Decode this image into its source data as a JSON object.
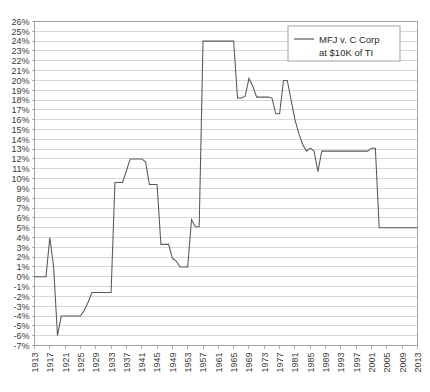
{
  "chart_data": {
    "type": "line",
    "title": "",
    "subtitle": "",
    "xlabel": "",
    "ylabel": "",
    "xlim": [
      1913,
      2013
    ],
    "ylim": [
      -7,
      26
    ],
    "ytick_step": 1,
    "xtick_step": 4,
    "grid": true,
    "grid_axis": "y",
    "legend_position": "top-right",
    "legend": [
      "MFJ v. C Corp at $10K of TI"
    ],
    "series": [
      {
        "name": "MFJ v. C Corp at $10K of TI",
        "color": "#585858",
        "x": [
          1913,
          1914,
          1915,
          1916,
          1917,
          1918,
          1919,
          1920,
          1921,
          1922,
          1923,
          1924,
          1925,
          1926,
          1927,
          1928,
          1929,
          1930,
          1931,
          1932,
          1933,
          1934,
          1935,
          1936,
          1937,
          1938,
          1939,
          1940,
          1941,
          1942,
          1943,
          1944,
          1945,
          1946,
          1947,
          1948,
          1949,
          1950,
          1951,
          1952,
          1953,
          1954,
          1955,
          1956,
          1957,
          1958,
          1959,
          1960,
          1961,
          1962,
          1963,
          1964,
          1965,
          1966,
          1967,
          1968,
          1969,
          1970,
          1971,
          1972,
          1973,
          1974,
          1975,
          1976,
          1977,
          1978,
          1979,
          1980,
          1981,
          1982,
          1983,
          1984,
          1985,
          1986,
          1987,
          1988,
          1989,
          1990,
          1991,
          1992,
          1993,
          1994,
          1995,
          1996,
          1997,
          1998,
          1999,
          2000,
          2001,
          2002,
          2003,
          2004,
          2005,
          2006,
          2007,
          2008,
          2009,
          2010,
          2011,
          2012,
          2013
        ],
        "y": [
          0,
          0,
          0,
          0,
          4,
          1,
          -6,
          -4,
          -4,
          -4,
          -4,
          -4,
          -4,
          -3.4,
          -2.6,
          -1.6,
          -1.6,
          -1.6,
          -1.6,
          -1.6,
          -1.6,
          9.6,
          9.6,
          9.6,
          10.8,
          12,
          12,
          12,
          12,
          11.7,
          9.4,
          9.4,
          9.4,
          3.3,
          3.3,
          3.3,
          1.9,
          1.6,
          1,
          1,
          1,
          5.8,
          5.1,
          5.1,
          24,
          24,
          24,
          24,
          24,
          24,
          24,
          24,
          24,
          18.2,
          18.2,
          18.4,
          20.2,
          19.4,
          18.3,
          18.3,
          18.3,
          18.3,
          18.2,
          16.6,
          16.6,
          20,
          20,
          18,
          16,
          14.6,
          13.5,
          12.8,
          13.1,
          12.8,
          10.7,
          12.8,
          12.8,
          12.8,
          12.8,
          12.8,
          12.8,
          12.8,
          12.8,
          12.8,
          12.8,
          12.8,
          12.8,
          12.8,
          13.1,
          13.1,
          5,
          5,
          5,
          5,
          5,
          5,
          5,
          5,
          5,
          5,
          5
        ]
      }
    ],
    "ytick_labels": [
      "26%",
      "25%",
      "24%",
      "23%",
      "22%",
      "21%",
      "20%",
      "19%",
      "18%",
      "17%",
      "16%",
      "15%",
      "14%",
      "13%",
      "12%",
      "11%",
      "10%",
      "9%",
      "8%",
      "7%",
      "6%",
      "5%",
      "4%",
      "3%",
      "2%",
      "1%",
      "0%",
      "-1%",
      "-2%",
      "-3%",
      "-4%",
      "-5%",
      "-6%",
      "-7%"
    ],
    "ytick_values": [
      26,
      25,
      24,
      23,
      22,
      21,
      20,
      19,
      18,
      17,
      16,
      15,
      14,
      13,
      12,
      11,
      10,
      9,
      8,
      7,
      6,
      5,
      4,
      3,
      2,
      1,
      0,
      -1,
      -2,
      -3,
      -4,
      -5,
      -6,
      -7
    ],
    "xtick_labels": [
      "1913",
      "1917",
      "1921",
      "1925",
      "1929",
      "1933",
      "1937",
      "1941",
      "1945",
      "1949",
      "1953",
      "1957",
      "1961",
      "1965",
      "1969",
      "1973",
      "1977",
      "1981",
      "1985",
      "1989",
      "1993",
      "1997",
      "2001",
      "2005",
      "2009",
      "2013"
    ],
    "xtick_values": [
      1913,
      1917,
      1921,
      1925,
      1929,
      1933,
      1937,
      1941,
      1945,
      1949,
      1953,
      1957,
      1961,
      1965,
      1969,
      1973,
      1977,
      1981,
      1985,
      1989,
      1993,
      1997,
      2001,
      2005,
      2009,
      2013
    ]
  },
  "legend": {
    "line1": "MFJ v. C Corp",
    "line2": "at $10K of TI"
  },
  "colors": {
    "series": "#585858",
    "grid": "#c8c8c8",
    "border": "#9a9a9a",
    "text": "#2b2b2b",
    "background": "#ffffff"
  }
}
